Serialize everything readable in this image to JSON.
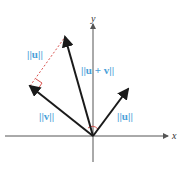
{
  "diagram": {
    "labels": {
      "u_top": "||u||",
      "u_plus_v": "||u + v||",
      "v": "||v||",
      "u_right": "||u||",
      "x_axis": "x",
      "y_axis": "y"
    },
    "colors": {
      "label": "#4a9fd8",
      "dashed": "#d9534f",
      "vector": "#1a1a1a",
      "axis": "#555555"
    },
    "points": {
      "origin": [
        93,
        136
      ],
      "u": [
        128,
        89
      ],
      "v": [
        30,
        86
      ],
      "u_plus_v": [
        65,
        37
      ]
    }
  }
}
